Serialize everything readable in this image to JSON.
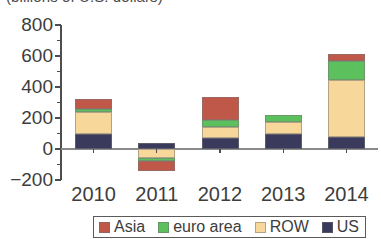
{
  "chart_data": {
    "type": "bar",
    "stacked": true,
    "title": "(billions of U.S. dollars)",
    "xlabel": "",
    "ylabel": "",
    "categories": [
      "2010",
      "2011",
      "2012",
      "2013",
      "2014"
    ],
    "ylim": [
      -200,
      800
    ],
    "yticks": [
      800,
      600,
      400,
      200,
      0,
      -200
    ],
    "ytick_labels": [
      "800",
      "600",
      "400",
      "200",
      "0",
      "−200"
    ],
    "minor_ticks": true,
    "grid": false,
    "legend_position": "bottom",
    "series": [
      {
        "name": "Asia",
        "color": "#c0584a",
        "values": [
          65,
          -60,
          145,
          0,
          45
        ]
      },
      {
        "name": "euro area",
        "color": "#5cc15c",
        "values": [
          15,
          -20,
          45,
          45,
          125
        ]
      },
      {
        "name": "ROW",
        "color": "#f8d89a",
        "values": [
          145,
          -60,
          75,
          75,
          370
        ]
      },
      {
        "name": "US",
        "color": "#3a3a5c",
        "values": [
          95,
          40,
          70,
          100,
          75
        ]
      }
    ],
    "totals": [
      320,
      -100,
      335,
      220,
      615
    ],
    "stack_order_bottom_to_top": [
      "US",
      "ROW",
      "euro area",
      "Asia"
    ]
  },
  "legend": {
    "entries": [
      {
        "label": "Asia",
        "color": "#c0584a"
      },
      {
        "label": "euro area",
        "color": "#5cc15c"
      },
      {
        "label": "ROW",
        "color": "#f8d89a"
      },
      {
        "label": "US",
        "color": "#3a3a5c"
      }
    ]
  }
}
